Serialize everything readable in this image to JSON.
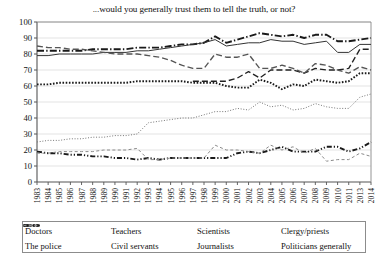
{
  "chart_data": {
    "type": "line",
    "title": "...would you generally trust them to tell the truth, or not?",
    "xlabel": "",
    "ylabel": "",
    "ylim": [
      0,
      100
    ],
    "ytick_step": 10,
    "yticks": [
      0,
      10,
      20,
      30,
      40,
      50,
      60,
      70,
      80,
      90,
      100
    ],
    "grid": true,
    "legend_position": "bottom",
    "x": [
      1983,
      1984,
      1985,
      1986,
      1987,
      1988,
      1989,
      1990,
      1991,
      1992,
      1993,
      1994,
      1995,
      1996,
      1997,
      1998,
      1999,
      2000,
      2001,
      2002,
      2003,
      2004,
      2005,
      2006,
      2007,
      2008,
      2009,
      2010,
      2011,
      2013,
      2014
    ],
    "series": [
      {
        "name": "Doctors",
        "style": "dash-dot",
        "width": "bold",
        "color": "#1a1a1a",
        "values": [
          82,
          82,
          82,
          82,
          82,
          83,
          83,
          83,
          83,
          84,
          84,
          84,
          85,
          86,
          86,
          87,
          91,
          87,
          89,
          91,
          93,
          92,
          91,
          92,
          90,
          92,
          92,
          88,
          88,
          89,
          90
        ]
      },
      {
        "name": "Teachers",
        "style": "solid",
        "width": "thin",
        "color": "#333333",
        "values": [
          79,
          79,
          80,
          80,
          80,
          80,
          81,
          81,
          81,
          82,
          82,
          83,
          84,
          85,
          86,
          87,
          89,
          85,
          86,
          87,
          87,
          89,
          88,
          88,
          86,
          87,
          88,
          81,
          81,
          86,
          86
        ]
      },
      {
        "name": "Scientists",
        "style": "dashed",
        "width": "medium",
        "color": "#222222",
        "values": [
          null,
          null,
          null,
          null,
          null,
          null,
          null,
          null,
          null,
          null,
          null,
          null,
          null,
          null,
          63,
          63,
          63,
          63,
          65,
          69,
          65,
          70,
          70,
          70,
          68,
          71,
          70,
          70,
          71,
          83,
          83
        ]
      },
      {
        "name": "Clergy/priests",
        "style": "dashed",
        "width": "medium",
        "color": "#555555",
        "values": [
          85,
          84,
          84,
          83,
          83,
          82,
          81,
          80,
          80,
          80,
          79,
          78,
          76,
          73,
          71,
          71,
          80,
          78,
          78,
          80,
          71,
          71,
          73,
          71,
          68,
          74,
          73,
          70,
          68,
          72,
          70
        ]
      },
      {
        "name": "The police",
        "style": "dotted",
        "width": "bold",
        "color": "#1a1a1a",
        "values": [
          61,
          61,
          62,
          62,
          62,
          62,
          62,
          62,
          62,
          63,
          63,
          63,
          63,
          63,
          62,
          62,
          62,
          60,
          59,
          59,
          64,
          62,
          58,
          61,
          60,
          64,
          63,
          62,
          63,
          68,
          68
        ]
      },
      {
        "name": "Civil servants",
        "style": "fine-dotted",
        "width": "thin",
        "color": "#777777",
        "values": [
          25,
          26,
          26,
          27,
          27,
          28,
          28,
          29,
          29,
          30,
          37,
          38,
          39,
          40,
          40,
          42,
          44,
          44,
          46,
          45,
          50,
          47,
          48,
          45,
          46,
          49,
          47,
          46,
          46,
          53,
          55
        ]
      },
      {
        "name": "Journalists",
        "style": "dash-dot-dot",
        "width": "bold",
        "color": "#1a1a1a",
        "values": [
          19,
          18,
          18,
          17,
          17,
          16,
          16,
          15,
          15,
          14,
          15,
          14,
          15,
          15,
          15,
          15,
          15,
          15,
          18,
          19,
          18,
          20,
          22,
          19,
          19,
          19,
          22,
          22,
          19,
          21,
          25
        ]
      },
      {
        "name": "Politicians generally",
        "style": "fine-dashed",
        "width": "thin",
        "color": "#8a8a8a",
        "values": [
          18,
          18,
          19,
          19,
          19,
          19,
          20,
          20,
          20,
          21,
          14,
          14,
          15,
          15,
          15,
          15,
          23,
          20,
          20,
          19,
          18,
          23,
          20,
          22,
          18,
          21,
          13,
          14,
          14,
          18,
          16
        ]
      }
    ]
  },
  "legend": {
    "items": [
      {
        "label": "Doctors"
      },
      {
        "label": "Teachers"
      },
      {
        "label": "Scientists"
      },
      {
        "label": "Clergy/priests"
      },
      {
        "label": "The police"
      },
      {
        "label": "Civil servants"
      },
      {
        "label": "Journalists"
      },
      {
        "label": "Politicians generally"
      }
    ]
  }
}
